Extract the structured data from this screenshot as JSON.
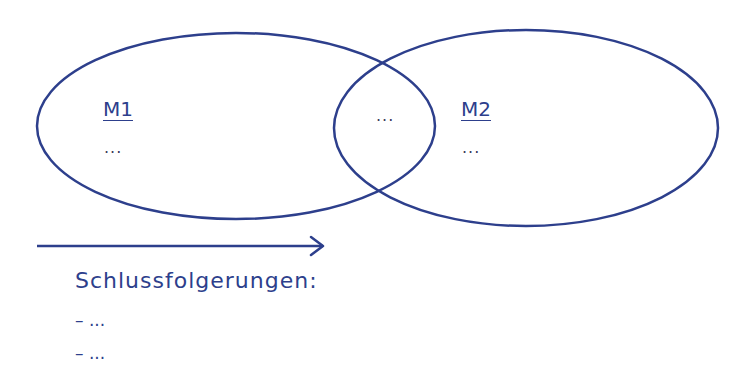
{
  "sets": [
    {
      "id": "M1",
      "title": "M1",
      "content": "..."
    },
    {
      "id": "M2",
      "title": "M2",
      "content": "..."
    }
  ],
  "intersection": {
    "content": "..."
  },
  "arrow": {
    "direction": "right"
  },
  "conclusions": {
    "title": "Schlussfolgerungen:",
    "items": [
      "– ...",
      "– ..."
    ]
  },
  "colors": {
    "stroke": "#2d3f8c",
    "background": "#ffffff"
  }
}
